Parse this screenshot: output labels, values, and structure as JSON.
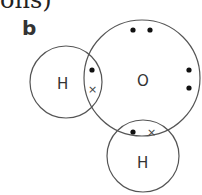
{
  "caption": {
    "top_text": "ons)",
    "part_label": "b"
  },
  "diagram": {
    "atoms": [
      {
        "symbol": "H",
        "position": "left"
      },
      {
        "symbol": "O",
        "position": "center"
      },
      {
        "symbol": "H",
        "position": "bottom"
      }
    ],
    "electrons": {
      "oxygen_dot_symbol": "•",
      "hydrogen_cross_symbol": "×"
    },
    "colors": {
      "line": "#555555",
      "dot": "#111111",
      "text": "#333333"
    }
  }
}
